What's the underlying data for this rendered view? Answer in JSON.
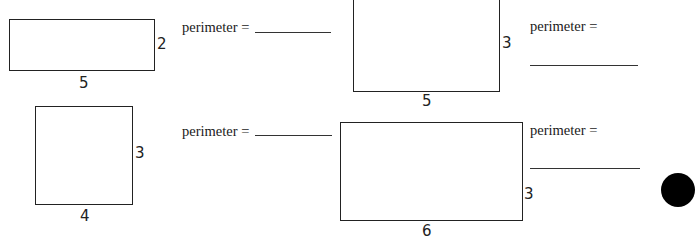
{
  "worksheet": {
    "problems": [
      {
        "id": 1,
        "width_label": "5",
        "height_label": "2",
        "prompt": "perimeter =",
        "answer": ""
      },
      {
        "id": 2,
        "width_label": "5",
        "height_label": "3",
        "prompt": "perimeter =",
        "answer": ""
      },
      {
        "id": 3,
        "width_label": "4",
        "height_label": "3",
        "prompt": "perimeter =",
        "answer": ""
      },
      {
        "id": 4,
        "width_label": "6",
        "height_label": "3",
        "prompt": "perimeter =",
        "answer": ""
      }
    ]
  },
  "colors": {
    "ink": "#222222",
    "paper": "#ffffff",
    "hole_punch": "#000000"
  }
}
